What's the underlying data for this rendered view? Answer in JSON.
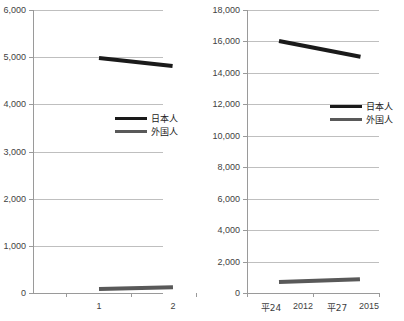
{
  "chart_data": [
    {
      "id": "left",
      "type": "line",
      "title": "",
      "xlabel": "",
      "ylabel": "",
      "categories": [
        "1",
        "2"
      ],
      "ylim": [
        0,
        6000
      ],
      "yticks": [
        "0",
        "1,000",
        "2,000",
        "3,000",
        "4,000",
        "5,000",
        "6,000"
      ],
      "ytick_values": [
        0,
        1000,
        2000,
        3000,
        4000,
        5000,
        6000
      ],
      "grid": true,
      "legend_position": "center-right",
      "series": [
        {
          "name": "日本人",
          "color": "#1a1a1a",
          "values": [
            4980,
            4810
          ]
        },
        {
          "name": "外国人",
          "color": "#595959",
          "values": [
            85,
            120
          ]
        }
      ]
    },
    {
      "id": "right",
      "type": "line",
      "title": "",
      "xlabel": "",
      "ylabel": "",
      "categories": [
        "平24",
        "2012",
        "平27",
        "2015"
      ],
      "ylim": [
        0,
        18000
      ],
      "yticks": [
        "0",
        "2,000",
        "4,000",
        "6,000",
        "8,000",
        "10,000",
        "12,000",
        "14,000",
        "16,000",
        "18,000"
      ],
      "ytick_values": [
        0,
        2000,
        4000,
        6000,
        8000,
        10000,
        12000,
        14000,
        16000,
        18000
      ],
      "grid": true,
      "legend_position": "center-right",
      "series": [
        {
          "name": "日本人",
          "color": "#1a1a1a",
          "values": [
            16000,
            15000
          ]
        },
        {
          "name": "外国人",
          "color": "#595959",
          "values": [
            700,
            880
          ]
        }
      ]
    }
  ]
}
